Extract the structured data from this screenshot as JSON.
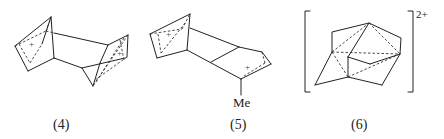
{
  "structures": [
    {
      "id": "4",
      "label": "(4)",
      "charge_symbols": [
        "+",
        "+"
      ]
    },
    {
      "id": "5",
      "label": "(5)",
      "charge_symbols": [
        "+",
        "+"
      ],
      "substituent": "Me"
    },
    {
      "id": "6",
      "label": "(6)",
      "charge": "2+"
    }
  ]
}
